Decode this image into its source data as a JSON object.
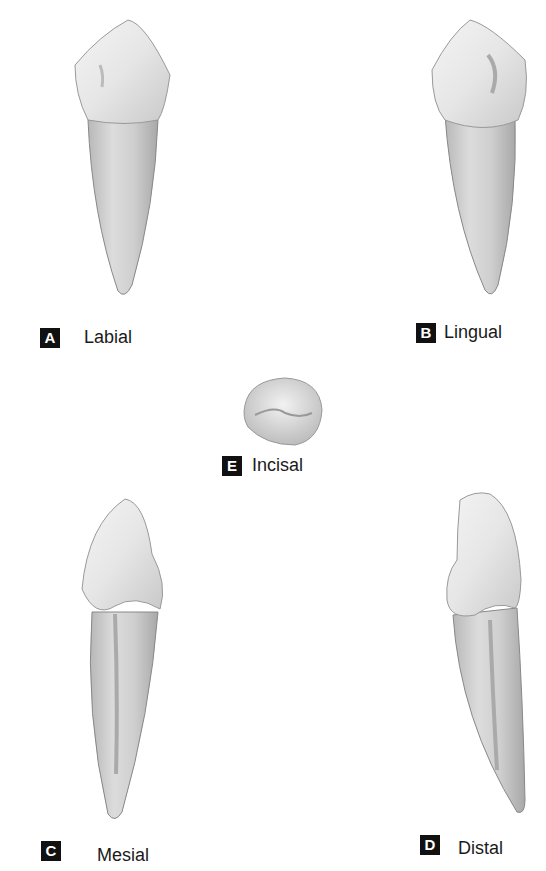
{
  "figure": {
    "views": [
      {
        "letter": "A",
        "name": "Labial"
      },
      {
        "letter": "B",
        "name": "Lingual"
      },
      {
        "letter": "C",
        "name": "Mesial"
      },
      {
        "letter": "D",
        "name": "Distal"
      },
      {
        "letter": "E",
        "name": "Incisal"
      }
    ]
  }
}
